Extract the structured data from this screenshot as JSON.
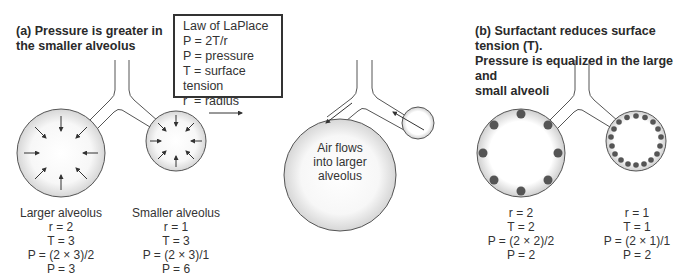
{
  "panel_a": {
    "title_line1": "(a) Pressure is greater in",
    "title_line2": "the smaller alveolus",
    "law_box": {
      "title": "Law of LaPlace",
      "lines": [
        "P = 2T/r",
        "P = pressure",
        "T = surface tension",
        "r  = radius"
      ]
    },
    "larger": {
      "name": "Larger alveolus",
      "r": "r = 2",
      "T": "T = 3",
      "formula": "P = (2 × 3)/2",
      "P": "P = 3"
    },
    "smaller": {
      "name": "Smaller alveolus",
      "r": "r = 1",
      "T": "T = 3",
      "formula": "P = (2 × 3)/1",
      "P": "P = 6"
    },
    "result_caption": [
      "Air flows",
      "into larger",
      "alveolus"
    ]
  },
  "panel_b": {
    "title_line1": "(b) Surfactant reduces surface tension (T).",
    "title_line2": "Pressure is equalized in the large and",
    "title_line3": "small alveoli",
    "larger": {
      "r": "r = 2",
      "T": "T = 2",
      "formula": "P = (2 × 2)/2",
      "P": "P = 2"
    },
    "smaller": {
      "r": "r = 1",
      "T": "T = 1",
      "formula": "P = (2 × 1)/1",
      "P": "P = 2"
    }
  },
  "colors": {
    "outline": "#555555",
    "alveolus_fill_edge": "#d8d8d8",
    "surfactant_dot": "#555555"
  }
}
